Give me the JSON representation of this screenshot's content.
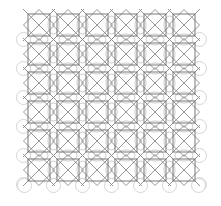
{
  "diagram": {
    "type": "geometric-tiling-pattern",
    "grid": {
      "rows": 6,
      "cols": 6,
      "origin_x": 28,
      "origin_y": 14,
      "pitch": 29,
      "cell_size": 22
    },
    "colors": {
      "background": "#ffffff",
      "square_stroke": "#6b6b6b",
      "diagonal_stroke": "#8a8a8a",
      "arc_stroke": "#c4c4c4",
      "circle_stroke": "#cfcfcf"
    },
    "stroke_width": 0.9,
    "boundary_circles": {
      "radius": 7,
      "sides": [
        "left",
        "right",
        "bottom"
      ]
    }
  }
}
